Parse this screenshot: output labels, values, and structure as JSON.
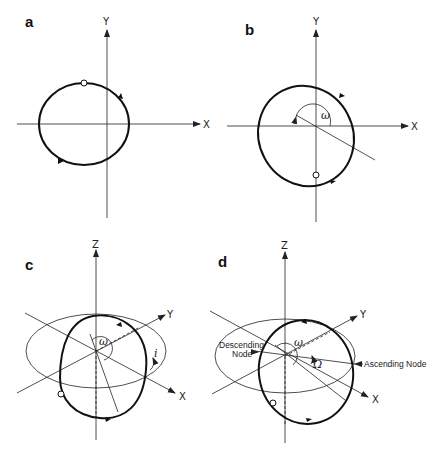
{
  "figure": {
    "panels": [
      {
        "id": "a",
        "label": "a",
        "axes": [
          "X",
          "Y"
        ],
        "description": "Orbit in plane with pericenter marker on top"
      },
      {
        "id": "b",
        "label": "b",
        "axes": [
          "X",
          "Y"
        ],
        "angle_label": "ω",
        "description": "Orbit rotated by argument of periapsis ω"
      },
      {
        "id": "c",
        "label": "c",
        "axes": [
          "X",
          "Y",
          "Z"
        ],
        "angle_labels": [
          "ω",
          "i"
        ],
        "description": "Orbit inclined by i relative to reference plane"
      },
      {
        "id": "d",
        "label": "d",
        "axes": [
          "X",
          "Y",
          "Z"
        ],
        "angle_labels": [
          "ω",
          "Ω"
        ],
        "node_labels": [
          "Descending Node",
          "Ascending Node"
        ],
        "description": "Orbit rotated by longitude of ascending node Ω"
      }
    ]
  },
  "panel_a": {
    "label": "a",
    "x_axis": "X",
    "y_axis": "Y"
  },
  "panel_b": {
    "label": "b",
    "x_axis": "X",
    "y_axis": "Y",
    "omega": "ω"
  },
  "panel_c": {
    "label": "c",
    "x_axis": "X",
    "y_axis": "Y",
    "z_axis": "Z",
    "omega": "ω",
    "inclination": "i"
  },
  "panel_d": {
    "label": "d",
    "x_axis": "X",
    "y_axis": "Y",
    "z_axis": "Z",
    "omega": "ω",
    "Omega": "Ω",
    "descending_line1": "Descending",
    "descending_line2": "Node",
    "ascending": "Ascending Node"
  }
}
